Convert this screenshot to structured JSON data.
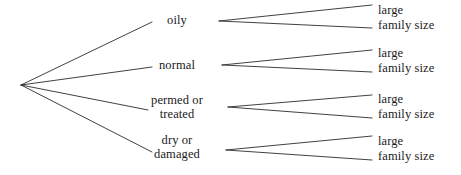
{
  "diagram": {
    "type": "probability-tree-diagram",
    "title": "",
    "line_color": "#2b2b2b",
    "text_color": "#1a1a1a",
    "background": "#ffffff",
    "root": {
      "label": "",
      "x": 21,
      "y": 85
    },
    "level1": {
      "anchor_x": 177,
      "branches": [
        {
          "id": "oily",
          "label": "oily",
          "label_line2": "",
          "x": 177,
          "y": 14,
          "line": {
            "x1": 21,
            "y1": 85,
            "x2": 152,
            "y2": 22
          },
          "vertex": {
            "x": 219,
            "y": 21
          },
          "children": [
            {
              "id": "oily-large",
              "label": "large",
              "x": 378,
              "y": 4,
              "line": {
                "x1": 219,
                "y1": 21,
                "x2": 372,
                "y2": 5
              }
            },
            {
              "id": "oily-family-size",
              "label": "family size",
              "x": 378,
              "y": 19,
              "line": {
                "x1": 219,
                "y1": 21,
                "x2": 372,
                "y2": 28
              }
            }
          ]
        },
        {
          "id": "normal",
          "label": "normal",
          "label_line2": "",
          "x": 177,
          "y": 59,
          "line": {
            "x1": 21,
            "y1": 85,
            "x2": 152,
            "y2": 67
          },
          "vertex": {
            "x": 222,
            "y": 65
          },
          "children": [
            {
              "id": "normal-large",
              "label": "large",
              "x": 378,
              "y": 47,
              "line": {
                "x1": 222,
                "y1": 65,
                "x2": 372,
                "y2": 50
              }
            },
            {
              "id": "normal-family-size",
              "label": "family size",
              "x": 378,
              "y": 62,
              "line": {
                "x1": 222,
                "y1": 65,
                "x2": 372,
                "y2": 72
              }
            }
          ]
        },
        {
          "id": "permed-or-treated",
          "label": "permed or",
          "label_line2": "treated",
          "x": 177,
          "y": 94,
          "line": {
            "x1": 21,
            "y1": 85,
            "x2": 148,
            "y2": 110
          },
          "vertex": {
            "x": 228,
            "y": 107
          },
          "children": [
            {
              "id": "permed-large",
              "label": "large",
              "x": 378,
              "y": 93,
              "line": {
                "x1": 228,
                "y1": 107,
                "x2": 372,
                "y2": 95
              }
            },
            {
              "id": "permed-family-size",
              "label": "family size",
              "x": 378,
              "y": 108,
              "line": {
                "x1": 228,
                "y1": 107,
                "x2": 372,
                "y2": 118
              }
            }
          ]
        },
        {
          "id": "dry-or-damaged",
          "label": "dry or",
          "label_line2": "damaged",
          "x": 177,
          "y": 134,
          "line": {
            "x1": 21,
            "y1": 85,
            "x2": 152,
            "y2": 152
          },
          "vertex": {
            "x": 226,
            "y": 150
          },
          "children": [
            {
              "id": "dry-large",
              "label": "large",
              "x": 378,
              "y": 135,
              "line": {
                "x1": 226,
                "y1": 150,
                "x2": 372,
                "y2": 136
              }
            },
            {
              "id": "dry-family-size",
              "label": "family size",
              "x": 378,
              "y": 150,
              "line": {
                "x1": 226,
                "y1": 150,
                "x2": 372,
                "y2": 160
              }
            }
          ]
        }
      ]
    }
  }
}
